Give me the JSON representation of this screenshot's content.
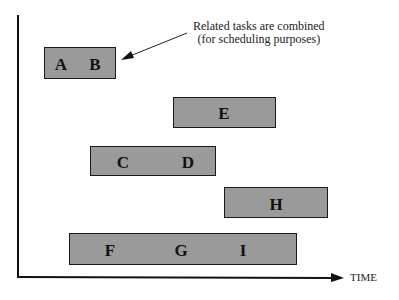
{
  "diagram": {
    "annotation": {
      "line1": "Related tasks are combined",
      "line2": "(for scheduling purposes)"
    },
    "x_axis_label": "TIME",
    "fill_color": "#9a9a9a",
    "tasks": [
      {
        "id": "AB",
        "labels": [
          "A",
          "B"
        ]
      },
      {
        "id": "E",
        "labels": [
          "E"
        ]
      },
      {
        "id": "CD",
        "labels": [
          "C",
          "D"
        ]
      },
      {
        "id": "H",
        "labels": [
          "H"
        ]
      },
      {
        "id": "FGI",
        "labels": [
          "F",
          "G",
          "I"
        ]
      }
    ]
  }
}
